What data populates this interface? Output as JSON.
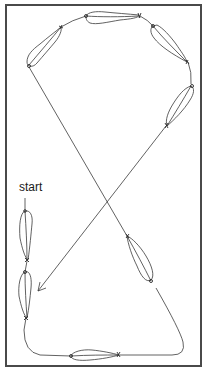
{
  "diagram": {
    "type": "figure-eight flight pattern",
    "start_label": "start",
    "colors": {
      "frame": "#4a4a4a",
      "lines": "#3a3a3a",
      "background": "#ffffff"
    },
    "elements": [
      {
        "name": "start-marker",
        "label": "start"
      },
      {
        "name": "shape-left-lower-1",
        "position": "left, below start"
      },
      {
        "name": "shape-left-lower-2",
        "position": "left, bottom"
      },
      {
        "name": "shape-bottom",
        "position": "bottom center"
      },
      {
        "name": "shape-right-lower",
        "position": "right, lower diagonal"
      },
      {
        "name": "shape-right-upper",
        "position": "right, upper"
      },
      {
        "name": "shape-right-top",
        "position": "top right"
      },
      {
        "name": "shape-top",
        "position": "top center"
      },
      {
        "name": "shape-left-top",
        "position": "top left"
      },
      {
        "name": "arrow-end",
        "position": "pointing down-left near left-lower shapes"
      }
    ]
  }
}
